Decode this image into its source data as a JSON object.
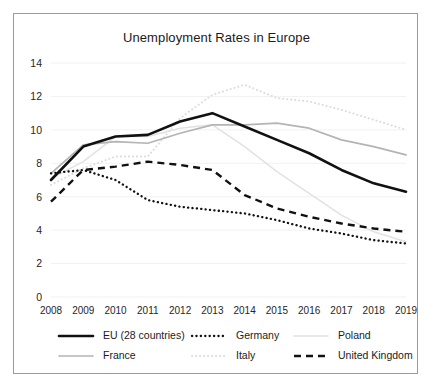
{
  "chart_data": {
    "type": "line",
    "title": "Unemployment Rates in Europe",
    "xlabel": "",
    "ylabel": "",
    "x": [
      "2008",
      "2009",
      "2010",
      "2011",
      "2012",
      "2013",
      "2014",
      "2015",
      "2016",
      "2017",
      "2018",
      "2019"
    ],
    "categories": [
      "2008",
      "2009",
      "2010",
      "2011",
      "2012",
      "2013",
      "2014",
      "2015",
      "2016",
      "2017",
      "2018",
      "2019"
    ],
    "ylim": [
      0,
      14
    ],
    "yticks": [
      0,
      2,
      4,
      6,
      8,
      10,
      12,
      14
    ],
    "grid": true,
    "legend_position": "bottom",
    "series": [
      {
        "name": "EU (28 countries)",
        "style": "solid-thick",
        "color": "#111111",
        "values": [
          7.0,
          9.0,
          9.6,
          9.7,
          10.5,
          11.0,
          10.2,
          9.4,
          8.6,
          7.6,
          6.8,
          6.3
        ]
      },
      {
        "name": "Germany",
        "style": "dotted",
        "color": "#111111",
        "values": [
          7.4,
          7.6,
          7.0,
          5.8,
          5.4,
          5.2,
          5.0,
          4.6,
          4.1,
          3.8,
          3.4,
          3.2
        ]
      },
      {
        "name": "Poland",
        "style": "solid-faint",
        "color": "#e2e2e2",
        "values": [
          7.1,
          8.1,
          9.6,
          9.6,
          10.1,
          10.3,
          9.0,
          7.5,
          6.2,
          4.9,
          3.9,
          3.3
        ]
      },
      {
        "name": "France",
        "style": "solid-gray",
        "color": "#b4b4b4",
        "values": [
          7.4,
          9.1,
          9.3,
          9.2,
          9.8,
          10.3,
          10.3,
          10.4,
          10.1,
          9.4,
          9.0,
          8.5
        ]
      },
      {
        "name": "Italy",
        "style": "dotted-faint",
        "color": "#dcdcdc",
        "values": [
          6.7,
          7.7,
          8.4,
          8.4,
          10.7,
          12.1,
          12.7,
          11.9,
          11.7,
          11.2,
          10.6,
          10.0
        ]
      },
      {
        "name": "United Kingdom",
        "style": "dashed",
        "color": "#111111",
        "values": [
          5.7,
          7.6,
          7.8,
          8.1,
          7.9,
          7.6,
          6.1,
          5.3,
          4.8,
          4.4,
          4.1,
          3.9
        ]
      }
    ]
  },
  "legend": {
    "entries": [
      {
        "label": "EU (28 countries)"
      },
      {
        "label": "Germany"
      },
      {
        "label": "Poland"
      },
      {
        "label": "France"
      },
      {
        "label": "Italy"
      },
      {
        "label": "United Kingdom"
      }
    ]
  }
}
